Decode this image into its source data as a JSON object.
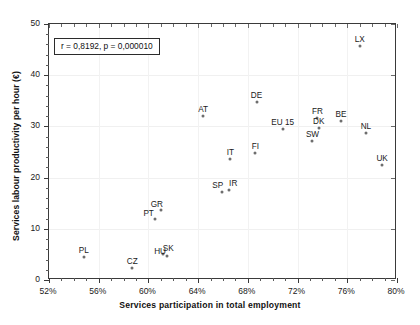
{
  "chart_data": {
    "type": "scatter",
    "title": "",
    "xlabel": "Services participation in total employment",
    "ylabel": "Services labour productivity per hour (€)",
    "xlim": [
      52,
      80
    ],
    "ylim": [
      0,
      50
    ],
    "xticks": [
      "52%",
      "56%",
      "60%",
      "64%",
      "68%",
      "72%",
      "76%",
      "80%"
    ],
    "xtick_values": [
      52,
      56,
      60,
      64,
      68,
      72,
      76,
      80
    ],
    "yticks": [
      "0",
      "10",
      "20",
      "30",
      "40",
      "50"
    ],
    "ytick_values": [
      0,
      10,
      20,
      30,
      40,
      50
    ],
    "grid": true,
    "legend": "none",
    "annotation": "r = 0,8192,  p = 0,000010",
    "marker_color": "#6e6e6e",
    "points": [
      {
        "label": "LX",
        "x": 77.0,
        "y": 45.7,
        "label_dx": 0,
        "label_dy": -11
      },
      {
        "label": "DE",
        "x": 68.7,
        "y": 34.8,
        "label_dx": 0,
        "label_dy": -11
      },
      {
        "label": "AT",
        "x": 64.4,
        "y": 32.1,
        "label_dx": 0,
        "label_dy": -11
      },
      {
        "label": "FR",
        "x": 73.6,
        "y": 31.6,
        "label_dx": 0,
        "label_dy": -11
      },
      {
        "label": "BE",
        "x": 75.5,
        "y": 31.1,
        "label_dx": 0,
        "label_dy": -11
      },
      {
        "label": "DK",
        "x": 73.7,
        "y": 29.7,
        "label_dx": 0,
        "label_dy": -11
      },
      {
        "label": "EU 15",
        "x": 70.8,
        "y": 29.5,
        "label_dx": 0,
        "label_dy": -11
      },
      {
        "label": "NL",
        "x": 77.5,
        "y": 28.7,
        "label_dx": 0,
        "label_dy": -11
      },
      {
        "label": "SW",
        "x": 73.2,
        "y": 27.2,
        "label_dx": 0,
        "label_dy": -11
      },
      {
        "label": "FI",
        "x": 68.6,
        "y": 24.8,
        "label_dx": 0,
        "label_dy": -11
      },
      {
        "label": "IT",
        "x": 66.6,
        "y": 23.6,
        "label_dx": 0,
        "label_dy": -11
      },
      {
        "label": "UK",
        "x": 78.8,
        "y": 22.5,
        "label_dx": 0,
        "label_dy": -11
      },
      {
        "label": "IR",
        "x": 66.5,
        "y": 17.6,
        "label_dx": 4,
        "label_dy": -11
      },
      {
        "label": "SP",
        "x": 65.9,
        "y": 17.2,
        "label_dx": -4,
        "label_dy": -11
      },
      {
        "label": "GR",
        "x": 61.0,
        "y": 13.7,
        "label_dx": -4,
        "label_dy": -10
      },
      {
        "label": "PT",
        "x": 60.5,
        "y": 11.9,
        "label_dx": -6,
        "label_dy": -10
      },
      {
        "label": "SK",
        "x": 61.2,
        "y": 5.1,
        "label_dx": 5,
        "label_dy": -10
      },
      {
        "label": "HU",
        "x": 61.5,
        "y": 4.7,
        "label_dx": -7,
        "label_dy": -9
      },
      {
        "label": "PL",
        "x": 54.8,
        "y": 4.5,
        "label_dx": 0,
        "label_dy": -11
      },
      {
        "label": "CZ",
        "x": 58.7,
        "y": 2.3,
        "label_dx": 0,
        "label_dy": -11
      }
    ]
  }
}
